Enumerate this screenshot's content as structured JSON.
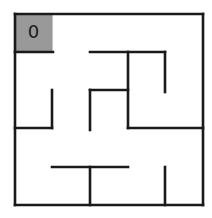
{
  "maze": {
    "rows": 5,
    "cols": 5,
    "origin": [
      15,
      14
    ],
    "size": [
      188,
      191
    ],
    "stroke_color": "#1a1a1a",
    "stroke_width": 2.6,
    "start_cell": {
      "row": 0,
      "col": 0,
      "label": "0",
      "fill": "#999999"
    },
    "walls": [
      {
        "x1": 15,
        "y1": 14,
        "x2": 203,
        "y2": 14
      },
      {
        "x1": 203,
        "y1": 14,
        "x2": 203,
        "y2": 205
      },
      {
        "x1": 15,
        "y1": 205,
        "x2": 203,
        "y2": 205
      },
      {
        "x1": 15,
        "y1": 14,
        "x2": 15,
        "y2": 205
      },
      {
        "x1": 15,
        "y1": 52,
        "x2": 53,
        "y2": 52
      },
      {
        "x1": 90,
        "y1": 52,
        "x2": 165,
        "y2": 52
      },
      {
        "x1": 128,
        "y1": 52,
        "x2": 128,
        "y2": 128
      },
      {
        "x1": 165,
        "y1": 52,
        "x2": 165,
        "y2": 92
      },
      {
        "x1": 52,
        "y1": 90,
        "x2": 52,
        "y2": 128
      },
      {
        "x1": 15,
        "y1": 128,
        "x2": 52,
        "y2": 128
      },
      {
        "x1": 90,
        "y1": 90,
        "x2": 128,
        "y2": 90
      },
      {
        "x1": 90,
        "y1": 90,
        "x2": 90,
        "y2": 130
      },
      {
        "x1": 128,
        "y1": 128,
        "x2": 203,
        "y2": 128
      },
      {
        "x1": 52,
        "y1": 167,
        "x2": 128,
        "y2": 167
      },
      {
        "x1": 90,
        "y1": 167,
        "x2": 90,
        "y2": 205
      },
      {
        "x1": 165,
        "y1": 167,
        "x2": 165,
        "y2": 205
      }
    ]
  }
}
